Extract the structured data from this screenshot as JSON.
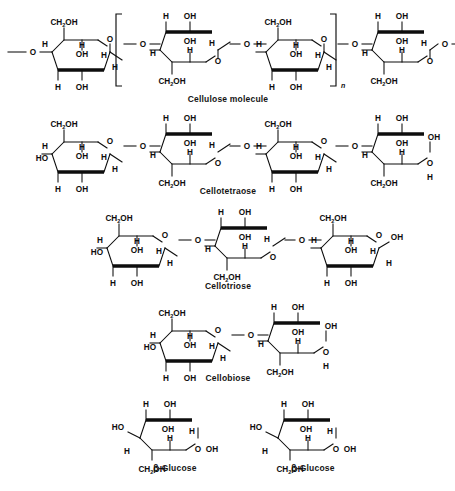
{
  "figure": {
    "background_color": "#ffffff",
    "ink_color": "#0d0d0d"
  },
  "rows": [
    {
      "id": "cellulose",
      "caption": "Cellulose molecule",
      "ring_count": 4,
      "left_terminal": "—O—",
      "right_terminal": "—O—",
      "brackets": true,
      "subscript": "n"
    },
    {
      "id": "cellotetraose",
      "caption": "Cellotetraose",
      "ring_count": 4,
      "left_terminal": "HO",
      "right_terminal": "OH",
      "brackets": false,
      "subscript": ""
    },
    {
      "id": "cellotriose",
      "caption": "Cellotriose",
      "ring_count": 3,
      "left_terminal": "HO",
      "right_terminal": "OH",
      "brackets": false,
      "subscript": ""
    },
    {
      "id": "cellobiose",
      "caption": "Cellobiose",
      "ring_count": 2,
      "left_terminal": "HO",
      "right_terminal": "OH",
      "brackets": false,
      "subscript": ""
    },
    {
      "id": "glucose-monomers",
      "caption": "",
      "ring_count": 2,
      "left_terminal": "HO",
      "right_terminal": "OH",
      "brackets": false,
      "subscript": ""
    }
  ],
  "monomer_captions": [
    {
      "id": "beta-glucose-left",
      "text": "β-Glucose"
    },
    {
      "id": "beta-glucose-right",
      "text": "β-Glucose"
    }
  ],
  "labels": {
    "ch2oh": "CH",
    "ch2oh_sub": "2",
    "ch2oh_tail": "OH",
    "oh": "OH",
    "ho": "HO",
    "h": "H",
    "o": "O",
    "n": "n"
  },
  "chemistry": {
    "projection": "Haworth",
    "linkage": "β-1,4-glycosidic",
    "ring_type": "pyranose",
    "alternating_orientation": true
  }
}
